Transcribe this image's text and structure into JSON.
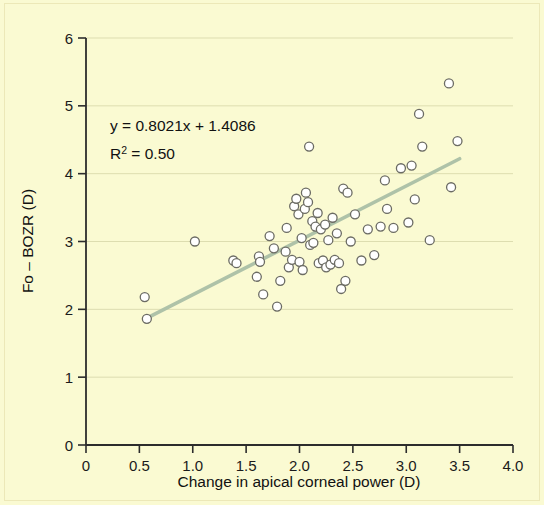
{
  "chart_data": {
    "type": "scatter",
    "title": "",
    "xlabel": "Change in apical corneal power (D)",
    "ylabel": "Fo – BOZR (D)",
    "xlim": [
      0,
      4.0
    ],
    "ylim": [
      0,
      6
    ],
    "xticks": [
      "0",
      "0.5",
      "1.0",
      "1.5",
      "2.0",
      "2.5",
      "3.0",
      "3.5",
      "4.0"
    ],
    "xtick_values": [
      0,
      0.5,
      1.0,
      1.5,
      2.0,
      2.5,
      3.0,
      3.5,
      4.0
    ],
    "yticks": [
      "0",
      "1",
      "2",
      "3",
      "4",
      "5",
      "6"
    ],
    "ytick_values": [
      0,
      1,
      2,
      3,
      4,
      5,
      6
    ],
    "grid": true,
    "grid_axis": "y",
    "grid_color": "#ddddb0",
    "legend": null,
    "marker": {
      "shape": "circle",
      "fill": "#ffffff",
      "stroke": "#6b6b63",
      "size": 9
    },
    "annotations": [
      {
        "id": "equation",
        "text": "y = 0.8021x + 1.4086",
        "x": 0.57,
        "y": 4.62
      },
      {
        "id": "r-squared",
        "text": "R² = 0.50",
        "x": 0.57,
        "y": 4.25
      }
    ],
    "trendline": {
      "type": "linear",
      "slope": 0.8021,
      "intercept": 1.4086,
      "equation": "y = 0.8021x + 1.4086",
      "r_squared": 0.5,
      "color": "#aec2a8",
      "x_start": 0.57,
      "x_end": 3.5,
      "y_start": 1.87,
      "y_end": 4.22
    },
    "points": [
      [
        0.55,
        2.18
      ],
      [
        0.57,
        1.86
      ],
      [
        1.02,
        3.0
      ],
      [
        1.38,
        2.72
      ],
      [
        1.41,
        2.68
      ],
      [
        1.6,
        2.48
      ],
      [
        1.62,
        2.78
      ],
      [
        1.63,
        2.7
      ],
      [
        1.66,
        2.22
      ],
      [
        1.72,
        3.08
      ],
      [
        1.76,
        2.9
      ],
      [
        1.79,
        2.04
      ],
      [
        1.82,
        2.42
      ],
      [
        1.87,
        2.85
      ],
      [
        1.88,
        3.2
      ],
      [
        1.9,
        2.62
      ],
      [
        1.93,
        2.73
      ],
      [
        1.95,
        3.52
      ],
      [
        1.97,
        3.63
      ],
      [
        1.99,
        3.4
      ],
      [
        2.0,
        2.7
      ],
      [
        2.02,
        3.05
      ],
      [
        2.03,
        2.58
      ],
      [
        2.05,
        3.48
      ],
      [
        2.06,
        3.72
      ],
      [
        2.08,
        3.58
      ],
      [
        2.09,
        4.4
      ],
      [
        2.1,
        2.95
      ],
      [
        2.12,
        3.3
      ],
      [
        2.13,
        2.98
      ],
      [
        2.15,
        3.22
      ],
      [
        2.17,
        3.42
      ],
      [
        2.18,
        2.68
      ],
      [
        2.2,
        3.18
      ],
      [
        2.22,
        2.72
      ],
      [
        2.24,
        3.25
      ],
      [
        2.25,
        2.62
      ],
      [
        2.27,
        3.02
      ],
      [
        2.29,
        2.66
      ],
      [
        2.31,
        3.35
      ],
      [
        2.33,
        2.73
      ],
      [
        2.35,
        3.12
      ],
      [
        2.37,
        2.68
      ],
      [
        2.39,
        2.3
      ],
      [
        2.41,
        3.78
      ],
      [
        2.43,
        2.42
      ],
      [
        2.45,
        3.72
      ],
      [
        2.48,
        3.0
      ],
      [
        2.52,
        3.4
      ],
      [
        2.58,
        2.72
      ],
      [
        2.64,
        3.18
      ],
      [
        2.7,
        2.8
      ],
      [
        2.76,
        3.22
      ],
      [
        2.8,
        3.9
      ],
      [
        2.82,
        3.48
      ],
      [
        2.88,
        3.2
      ],
      [
        2.95,
        4.08
      ],
      [
        3.02,
        3.28
      ],
      [
        3.05,
        4.12
      ],
      [
        3.08,
        3.62
      ],
      [
        3.12,
        4.88
      ],
      [
        3.15,
        4.4
      ],
      [
        3.22,
        3.02
      ],
      [
        3.4,
        5.33
      ],
      [
        3.42,
        3.8
      ],
      [
        3.48,
        4.48
      ]
    ]
  },
  "axis": {
    "x_title": "Change in apical corneal power (D)",
    "y_title": "Fo – BOZR (D)"
  },
  "equation": {
    "line1": "y = 0.8021x + 1.4086",
    "r_prefix": "R",
    "r_sup": "2",
    "r_suffix": " = 0.50"
  }
}
